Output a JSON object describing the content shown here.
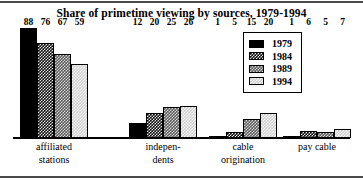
{
  "chart_data": {
    "type": "bar",
    "title": "Share of primetime viewing by sources, 1979-1994",
    "xlabel": "",
    "ylabel": "",
    "ylim": [
      0,
      88
    ],
    "grid": false,
    "legend_position": "top-right",
    "categories": [
      "affiliated stations",
      "independents",
      "cable origination",
      "pay cable"
    ],
    "category_lines": [
      [
        "affiliated",
        "stations"
      ],
      [
        "indepen-",
        "dents"
      ],
      [
        "cable",
        "origination"
      ],
      [
        "pay cable"
      ]
    ],
    "series": [
      {
        "name": "1979",
        "values": [
          88,
          12,
          1,
          1
        ]
      },
      {
        "name": "1984",
        "values": [
          76,
          20,
          5,
          6
        ]
      },
      {
        "name": "1989",
        "values": [
          67,
          25,
          15,
          5
        ]
      },
      {
        "name": "1994",
        "values": [
          59,
          26,
          20,
          7
        ]
      }
    ]
  },
  "legend": {
    "entries": [
      {
        "label": "1979"
      },
      {
        "label": "1984"
      },
      {
        "label": "1989"
      },
      {
        "label": "1994"
      }
    ]
  }
}
